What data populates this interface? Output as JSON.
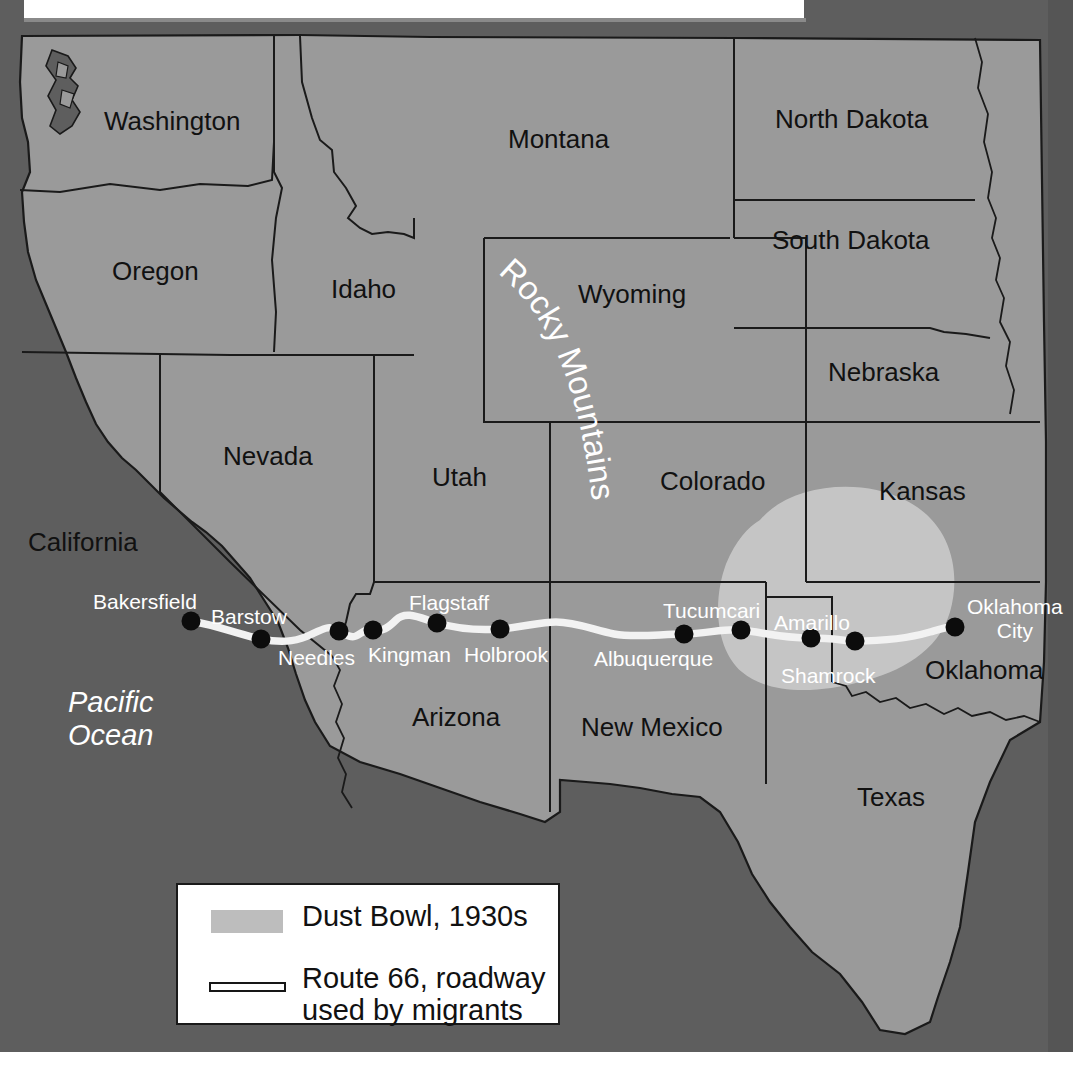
{
  "map": {
    "title_fragment": "",
    "colors": {
      "land": "#9a9a9a",
      "ocean": "#5e5e5e",
      "dust_bowl": "#c9c9c9",
      "route": "#f2f2f2",
      "border": "#1a1a1a",
      "city_dot": "#0c0c0c",
      "state_label": "#111111",
      "white_label": "#ffffff"
    },
    "states": [
      {
        "name": "Washington",
        "x": 104,
        "y": 108
      },
      {
        "name": "Oregon",
        "x": 112,
        "y": 258
      },
      {
        "name": "Idaho",
        "x": 331,
        "y": 276
      },
      {
        "name": "Montana",
        "x": 508,
        "y": 126
      },
      {
        "name": "North Dakota",
        "x": 775,
        "y": 106
      },
      {
        "name": "South Dakota",
        "x": 772,
        "y": 227
      },
      {
        "name": "Wyoming",
        "x": 578,
        "y": 281
      },
      {
        "name": "Nebraska",
        "x": 828,
        "y": 359
      },
      {
        "name": "Nevada",
        "x": 223,
        "y": 443
      },
      {
        "name": "Utah",
        "x": 432,
        "y": 464
      },
      {
        "name": "Colorado",
        "x": 660,
        "y": 468
      },
      {
        "name": "Kansas",
        "x": 879,
        "y": 478
      },
      {
        "name": "California",
        "x": 28,
        "y": 529
      },
      {
        "name": "Arizona",
        "x": 412,
        "y": 704
      },
      {
        "name": "New Mexico",
        "x": 581,
        "y": 714
      },
      {
        "name": "Oklahoma",
        "x": 925,
        "y": 657
      },
      {
        "name": "Texas",
        "x": 857,
        "y": 784
      }
    ],
    "feature_labels": [
      {
        "name": "Rocky Mountains",
        "style": "curved-white"
      },
      {
        "name": "Pacific Ocean",
        "line1": "Pacific",
        "line2": "Ocean",
        "x": 68,
        "y": 686
      }
    ],
    "route_name": "Route 66",
    "cities": [
      {
        "name": "Bakersfield",
        "dot_x": 191,
        "dot_y": 621,
        "label_x": 93,
        "label_y": 591,
        "align": "left"
      },
      {
        "name": "Barstow",
        "dot_x": 261,
        "dot_y": 639,
        "label_x": 211,
        "label_y": 606,
        "align": "left"
      },
      {
        "name": "Needles",
        "dot_x": 339,
        "dot_y": 631,
        "label_x": 278,
        "label_y": 647,
        "align": "left"
      },
      {
        "name": "Kingman",
        "dot_x": 373,
        "dot_y": 630,
        "label_x": 368,
        "label_y": 644,
        "align": "left"
      },
      {
        "name": "Flagstaff",
        "dot_x": 437,
        "dot_y": 623,
        "label_x": 409,
        "label_y": 592,
        "align": "left"
      },
      {
        "name": "Holbrook",
        "dot_x": 500,
        "dot_y": 629,
        "label_x": 464,
        "label_y": 644,
        "align": "left"
      },
      {
        "name": "Albuquerque",
        "dot_x": 684,
        "dot_y": 634,
        "label_x": 594,
        "label_y": 648,
        "align": "left"
      },
      {
        "name": "Tucumcari",
        "dot_x": 741,
        "dot_y": 630,
        "label_x": 663,
        "label_y": 600,
        "align": "left"
      },
      {
        "name": "Amarillo",
        "dot_x": 811,
        "dot_y": 638,
        "label_x": 774,
        "label_y": 612,
        "align": "left"
      },
      {
        "name": "Shamrock",
        "dot_x": 855,
        "dot_y": 641,
        "label_x": 781,
        "label_y": 665,
        "align": "left"
      },
      {
        "name": "Oklahoma City",
        "dot_x": 955,
        "dot_y": 627,
        "label_x": 969,
        "label_y": 596,
        "align": "two-line",
        "line1": "Oklahoma",
        "line2": "City"
      }
    ]
  },
  "legend": {
    "dust_bowl_label": "Dust Bowl, 1930s",
    "route_label_line1": "Route 66, roadway",
    "route_label_line2": "used by migrants"
  }
}
